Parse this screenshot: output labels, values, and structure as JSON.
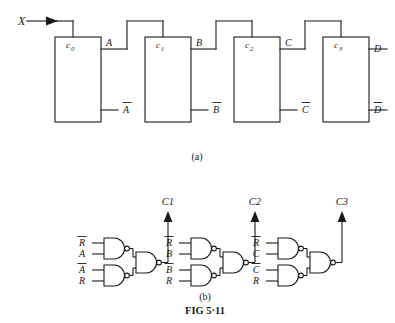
{
  "figure": {
    "id": "FIG 5·11",
    "part_a_label": "(a)",
    "part_b_label": "(b)"
  },
  "part_a": {
    "input_label": "X",
    "blocks": [
      {
        "name": "c",
        "subscript": "0",
        "out_true": "A",
        "out_comp": "A̅"
      },
      {
        "name": "c",
        "subscript": "1",
        "out_true": "B",
        "out_comp": "B̅"
      },
      {
        "name": "c",
        "subscript": "2",
        "out_true": "C",
        "out_comp": "C̅"
      },
      {
        "name": "c",
        "subscript": "3",
        "out_true": "D",
        "out_comp": "D̅"
      }
    ],
    "block_labels": [
      "c",
      "c",
      "c",
      "c"
    ],
    "block_subs": [
      "0",
      "1",
      "2",
      "3"
    ],
    "true_outputs": [
      "A",
      "B",
      "C",
      "D"
    ],
    "comp_outputs": [
      "A",
      "B",
      "C",
      "D"
    ]
  },
  "part_b": {
    "outputs": [
      "C1",
      "C2",
      "C3"
    ],
    "clusters": [
      {
        "output": "C1",
        "top_gate": {
          "type": "nand",
          "inputs": [
            "R̅",
            "A"
          ],
          "in_main": [
            "R",
            "A"
          ],
          "in_bar": [
            true,
            false
          ]
        },
        "bottom_gate": {
          "type": "nand",
          "inputs": [
            "A̅",
            "R"
          ],
          "in_main": [
            "A",
            "R"
          ],
          "in_bar": [
            true,
            false
          ]
        },
        "merge_gate": {
          "type": "nand"
        }
      },
      {
        "output": "C2",
        "top_gate": {
          "type": "nand",
          "inputs": [
            "R̅",
            "B"
          ],
          "in_main": [
            "R",
            "B"
          ],
          "in_bar": [
            true,
            false
          ]
        },
        "bottom_gate": {
          "type": "nand",
          "inputs": [
            "B̅",
            "R"
          ],
          "in_main": [
            "B",
            "R"
          ],
          "in_bar": [
            true,
            false
          ]
        },
        "merge_gate": {
          "type": "nand"
        }
      },
      {
        "output": "C3",
        "top_gate": {
          "type": "nand",
          "inputs": [
            "R̅",
            "C"
          ],
          "in_main": [
            "R",
            "C"
          ],
          "in_bar": [
            true,
            false
          ]
        },
        "bottom_gate": {
          "type": "nand",
          "inputs": [
            "C̅",
            "R"
          ],
          "in_main": [
            "C",
            "R"
          ],
          "in_bar": [
            true,
            false
          ]
        },
        "merge_gate": {
          "type": "nand"
        }
      }
    ]
  },
  "style": {
    "ink": "#1a1a1a",
    "paper": "#ffffff"
  }
}
